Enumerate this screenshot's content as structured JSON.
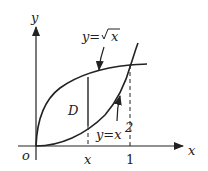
{
  "diagram": {
    "axis_x_label": "x",
    "axis_y_label": "y",
    "origin_label": "o",
    "tick_x_label": "x",
    "tick_one_label": "1",
    "region_label": "D",
    "curve_sqrt_label_y": "y=",
    "curve_sqrt_label_rhs": "x",
    "curve_square_label_y": "y=x",
    "curve_square_label_exp": "2"
  }
}
